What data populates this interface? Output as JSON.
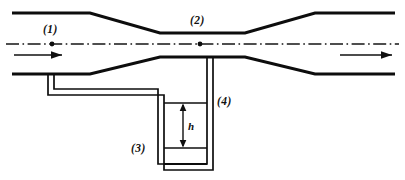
{
  "figure": {
    "background_color": "#ffffff",
    "line_color": "#0d0d0d",
    "width": 405,
    "height": 180
  },
  "labels": {
    "inlet_section": "(1)",
    "throat_section": "(2)",
    "manometer_left_level": "(3)",
    "manometer_right_leg": "(4)",
    "height_difference": "h"
  },
  "annotations": {
    "flow_arrow_inlet": "flow-direction-arrow",
    "flow_arrow_outlet": "flow-direction-arrow",
    "centerline": "axis-centerline",
    "tap_point_1": "pressure-tap-point",
    "tap_point_2": "pressure-tap-point"
  },
  "geometry": {
    "pipe_top_wall": "M 12 13 L 90 13 L 160 33 L 245 33 L 315 13 L 395 13",
    "pipe_bottom_wall": "M 12 74 L 90 74 L 160 57 L 245 57 L 315 74 L 395 74",
    "centerline_path": "M 6 44 L 399 44",
    "manometer_outer": "M 48 74 L 48 95 L 164 95 L 164 170 L 213 170 L 213 57",
    "manometer_inner": "M 54 74 L 54 89 L 158 89 L 158 164 L 207 164 L 207 57",
    "manometer_bottom_fill": "M 164 164 L 207 164",
    "upper_level_line": "M 164 103 L 207 103",
    "lower_level_line": "M 164 148 L 207 148",
    "dim_arrow_line": "M 183 105 L 183 146",
    "inlet_arrow": "M 14 55 L 62 55",
    "outlet_arrow": "M 340 55 L 392 55"
  }
}
